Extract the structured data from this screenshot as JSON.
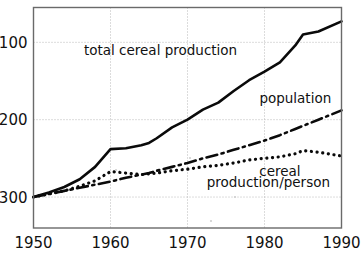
{
  "chart_data": {
    "type": "line",
    "title": "",
    "subtitle": "",
    "xlabel": "",
    "ylabel": "",
    "xlim": [
      1950,
      1990
    ],
    "ylim": [
      60,
      345
    ],
    "grid": true,
    "legend_position": "inline-annotations",
    "index_note": "Index, 1950 = 100",
    "x_ticks": [
      "1950",
      "1960",
      "1970",
      "1980",
      "1990"
    ],
    "x_tick_values": [
      1950,
      1960,
      1970,
      1980,
      1990
    ],
    "y_ticks": [
      "100",
      "200",
      "300"
    ],
    "y_tick_values": [
      100,
      200,
      300
    ],
    "x": [
      1950,
      1952,
      1954,
      1956,
      1958,
      1960,
      1962,
      1964,
      1965,
      1966,
      1968,
      1970,
      1972,
      1974,
      1976,
      1978,
      1980,
      1982,
      1984,
      1985,
      1987,
      1990
    ],
    "series": [
      {
        "name": "total cereal production",
        "style": "solid",
        "label": "total cereal production",
        "values": [
          100,
          106,
          113,
          123,
          139,
          162,
          163,
          167,
          170,
          176,
          190,
          200,
          213,
          222,
          237,
          251,
          262,
          274,
          296,
          310,
          314,
          327
        ]
      },
      {
        "name": "population",
        "style": "dash-dot",
        "label": "population",
        "values": [
          100,
          104,
          108,
          112,
          116,
          120,
          125,
          129,
          131,
          134,
          139,
          144,
          150,
          155,
          161,
          167,
          173,
          180,
          188,
          192,
          200,
          212
        ]
      },
      {
        "name": "cereal production/person",
        "style": "dotted",
        "label": "cereal production/person",
        "values": [
          100,
          104,
          108,
          114,
          121,
          133,
          131,
          129,
          130,
          131,
          134,
          136,
          139,
          141,
          144,
          148,
          150,
          152,
          156,
          160,
          158,
          153
        ]
      }
    ],
    "annotations": [
      {
        "id": "total-cereal-production",
        "text": "total cereal production",
        "x": 1966.5,
        "y": 283
      },
      {
        "id": "population",
        "text": "population",
        "x": 1984.0,
        "y": 222
      },
      {
        "id": "cereal",
        "text": "cereal",
        "x": 1982.0,
        "y": 127
      },
      {
        "id": "production-per-person",
        "text": "production/person",
        "x": 1980.5,
        "y": 113
      }
    ],
    "colors": {
      "line": "#0a0a0a",
      "grid": "#b9b9b9",
      "frame": "#6a6a6a",
      "text": "#111111",
      "background": "#ffffff"
    }
  },
  "axis": {
    "x_labels": [
      "1950",
      "1960",
      "1970",
      "1980",
      "1990"
    ],
    "y_labels": [
      "300",
      "200",
      "100"
    ]
  },
  "labels": {
    "total_cereal_production": "total cereal production",
    "population": "population",
    "cereal": "cereal",
    "production_per_person": "production/person"
  }
}
